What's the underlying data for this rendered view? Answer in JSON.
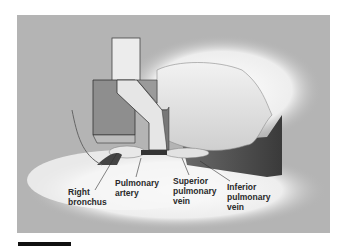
{
  "figure": {
    "background_color": "#b4b4b4",
    "labels": {
      "right_bronchus": [
        "Right",
        "bronchus"
      ],
      "pulmonary_artery": [
        "Pulmonary",
        "artery"
      ],
      "superior_pulmonary_vein": [
        "Superior",
        "pulmonary",
        "vein"
      ],
      "inferior_pulmonary_vein": [
        "Inferior",
        "pulmonary",
        "vein"
      ]
    }
  }
}
